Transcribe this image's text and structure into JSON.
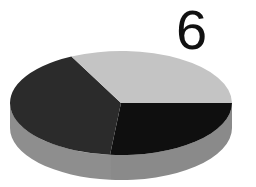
{
  "chart_data": {
    "type": "pie",
    "style": "3d",
    "title": "",
    "annotation": "6",
    "categories": [
      "Light gray slice",
      "Dark gray slice",
      "Black slice"
    ],
    "values": [
      32.4,
      41.1,
      26.6
    ],
    "colors": [
      "#c4c4c4",
      "#2b2b2b",
      "#0f0f0f"
    ],
    "side_colors": [
      "#a6a6a6",
      "#8e8e8e",
      "#8a8a8a"
    ],
    "legend": null,
    "data_labels": false
  },
  "label": {
    "text": "6"
  }
}
